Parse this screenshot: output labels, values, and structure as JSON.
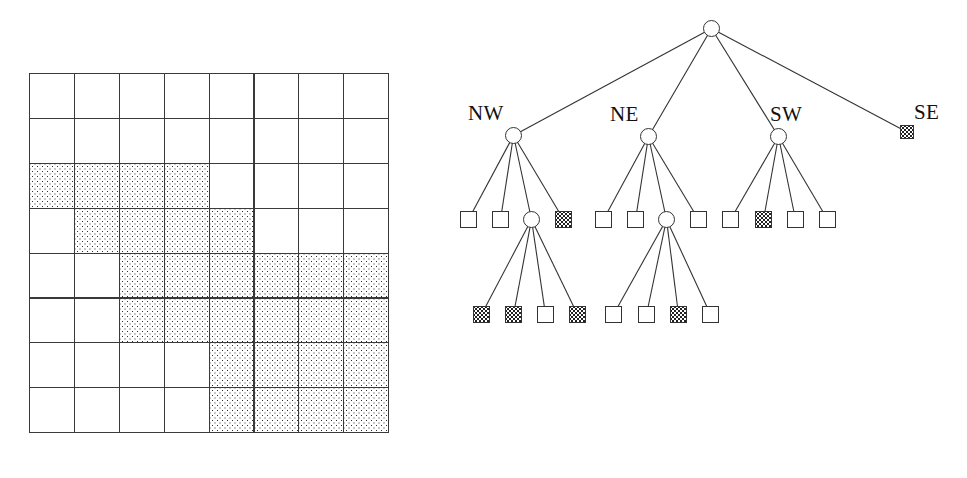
{
  "figure": {
    "background_color": "#ffffff",
    "line_color": "#333333",
    "shade_color": "#2b2b2b"
  },
  "grid": {
    "name": "region-quadtree-grid",
    "rows": 8,
    "cols": 8,
    "cell_size_px": 44.9,
    "origin": {
      "x": 29,
      "y": 73
    },
    "legend": {
      "shaded": "occupied / black node",
      "white": "empty / white node"
    },
    "cells": [
      [
        0,
        0,
        0,
        0,
        0,
        0,
        0,
        0
      ],
      [
        0,
        0,
        0,
        0,
        0,
        0,
        0,
        0
      ],
      [
        1,
        1,
        1,
        1,
        0,
        0,
        0,
        0
      ],
      [
        0,
        1,
        1,
        1,
        1,
        0,
        0,
        0
      ],
      [
        0,
        0,
        1,
        1,
        1,
        1,
        1,
        1
      ],
      [
        0,
        0,
        1,
        1,
        1,
        1,
        1,
        1
      ],
      [
        0,
        0,
        0,
        0,
        1,
        1,
        1,
        1
      ],
      [
        0,
        0,
        0,
        0,
        1,
        1,
        1,
        1
      ]
    ]
  },
  "tree": {
    "name": "quadtree-diagram",
    "labels": [
      {
        "id": "label-nw",
        "text": "NW",
        "x": 38,
        "y": 103
      },
      {
        "id": "label-ne",
        "text": "NE",
        "x": 180,
        "y": 104
      },
      {
        "id": "label-sw",
        "text": "SW",
        "x": 340,
        "y": 104
      },
      {
        "id": "label-se",
        "text": "SE",
        "x": 484,
        "y": 102
      }
    ],
    "nodes": [
      {
        "id": "root",
        "kind": "circle",
        "shaded": false,
        "x": 273,
        "y": 20,
        "size": 17,
        "label": "root"
      },
      {
        "id": "nw",
        "kind": "circle",
        "shaded": false,
        "x": 75,
        "y": 127,
        "size": 17,
        "label": "NW"
      },
      {
        "id": "ne",
        "kind": "circle",
        "shaded": false,
        "x": 210,
        "y": 128,
        "size": 17,
        "label": "NE"
      },
      {
        "id": "sw",
        "kind": "circle",
        "shaded": false,
        "x": 340,
        "y": 128,
        "size": 17,
        "label": "SW"
      },
      {
        "id": "se",
        "kind": "square",
        "shaded": true,
        "x": 470,
        "y": 125,
        "size": 14,
        "label": "SE"
      },
      {
        "id": "nw-nw",
        "kind": "square",
        "shaded": false,
        "x": 30,
        "y": 211,
        "size": 17,
        "label": "NW.NW"
      },
      {
        "id": "nw-ne",
        "kind": "square",
        "shaded": false,
        "x": 62,
        "y": 211,
        "size": 17,
        "label": "NW.NE"
      },
      {
        "id": "nw-sw",
        "kind": "circle",
        "shaded": false,
        "x": 93,
        "y": 211,
        "size": 17,
        "label": "NW.SW"
      },
      {
        "id": "nw-se",
        "kind": "square",
        "shaded": true,
        "x": 125,
        "y": 211,
        "size": 17,
        "label": "NW.SE"
      },
      {
        "id": "ne-nw",
        "kind": "square",
        "shaded": false,
        "x": 165,
        "y": 211,
        "size": 17,
        "label": "NE.NW"
      },
      {
        "id": "ne-ne",
        "kind": "square",
        "shaded": false,
        "x": 197,
        "y": 211,
        "size": 17,
        "label": "NE.NE"
      },
      {
        "id": "ne-sw",
        "kind": "circle",
        "shaded": false,
        "x": 228,
        "y": 211,
        "size": 17,
        "label": "NE.SW"
      },
      {
        "id": "ne-se",
        "kind": "square",
        "shaded": false,
        "x": 260,
        "y": 211,
        "size": 17,
        "label": "NE.SE"
      },
      {
        "id": "sw-nw",
        "kind": "square",
        "shaded": false,
        "x": 292,
        "y": 211,
        "size": 17,
        "label": "SW.NW"
      },
      {
        "id": "sw-ne",
        "kind": "square",
        "shaded": true,
        "x": 325,
        "y": 211,
        "size": 17,
        "label": "SW.NE"
      },
      {
        "id": "sw-sw",
        "kind": "square",
        "shaded": false,
        "x": 357,
        "y": 211,
        "size": 17,
        "label": "SW.SW"
      },
      {
        "id": "sw-se",
        "kind": "square",
        "shaded": false,
        "x": 389,
        "y": 211,
        "size": 17,
        "label": "SW.SE"
      },
      {
        "id": "nw-sw-nw",
        "kind": "square",
        "shaded": true,
        "x": 43,
        "y": 306,
        "size": 17,
        "label": "NW.SW.NW"
      },
      {
        "id": "nw-sw-ne",
        "kind": "square",
        "shaded": true,
        "x": 75,
        "y": 306,
        "size": 17,
        "label": "NW.SW.NE"
      },
      {
        "id": "nw-sw-sw",
        "kind": "square",
        "shaded": false,
        "x": 107,
        "y": 306,
        "size": 17,
        "label": "NW.SW.SW"
      },
      {
        "id": "nw-sw-se",
        "kind": "square",
        "shaded": true,
        "x": 139,
        "y": 306,
        "size": 17,
        "label": "NW.SW.SE"
      },
      {
        "id": "ne-sw-nw",
        "kind": "square",
        "shaded": false,
        "x": 175,
        "y": 306,
        "size": 17,
        "label": "NE.SW.NW"
      },
      {
        "id": "ne-sw-ne",
        "kind": "square",
        "shaded": false,
        "x": 208,
        "y": 306,
        "size": 17,
        "label": "NE.SW.NE"
      },
      {
        "id": "ne-sw-sw",
        "kind": "square",
        "shaded": true,
        "x": 240,
        "y": 306,
        "size": 17,
        "label": "NE.SW.SW"
      },
      {
        "id": "ne-sw-se",
        "kind": "square",
        "shaded": false,
        "x": 272,
        "y": 306,
        "size": 17,
        "label": "NE.SW.SE"
      }
    ],
    "edges": [
      {
        "from": "root",
        "to": "nw"
      },
      {
        "from": "root",
        "to": "ne"
      },
      {
        "from": "root",
        "to": "sw"
      },
      {
        "from": "root",
        "to": "se"
      },
      {
        "from": "nw",
        "to": "nw-nw"
      },
      {
        "from": "nw",
        "to": "nw-ne"
      },
      {
        "from": "nw",
        "to": "nw-sw"
      },
      {
        "from": "nw",
        "to": "nw-se"
      },
      {
        "from": "ne",
        "to": "ne-nw"
      },
      {
        "from": "ne",
        "to": "ne-ne"
      },
      {
        "from": "ne",
        "to": "ne-sw"
      },
      {
        "from": "ne",
        "to": "ne-se"
      },
      {
        "from": "sw",
        "to": "sw-nw"
      },
      {
        "from": "sw",
        "to": "sw-ne"
      },
      {
        "from": "sw",
        "to": "sw-sw"
      },
      {
        "from": "sw",
        "to": "sw-se"
      },
      {
        "from": "nw-sw",
        "to": "nw-sw-nw"
      },
      {
        "from": "nw-sw",
        "to": "nw-sw-ne"
      },
      {
        "from": "nw-sw",
        "to": "nw-sw-sw"
      },
      {
        "from": "nw-sw",
        "to": "nw-sw-se"
      },
      {
        "from": "ne-sw",
        "to": "ne-sw-nw"
      },
      {
        "from": "ne-sw",
        "to": "ne-sw-ne"
      },
      {
        "from": "ne-sw",
        "to": "ne-sw-sw"
      },
      {
        "from": "ne-sw",
        "to": "ne-sw-se"
      }
    ]
  }
}
